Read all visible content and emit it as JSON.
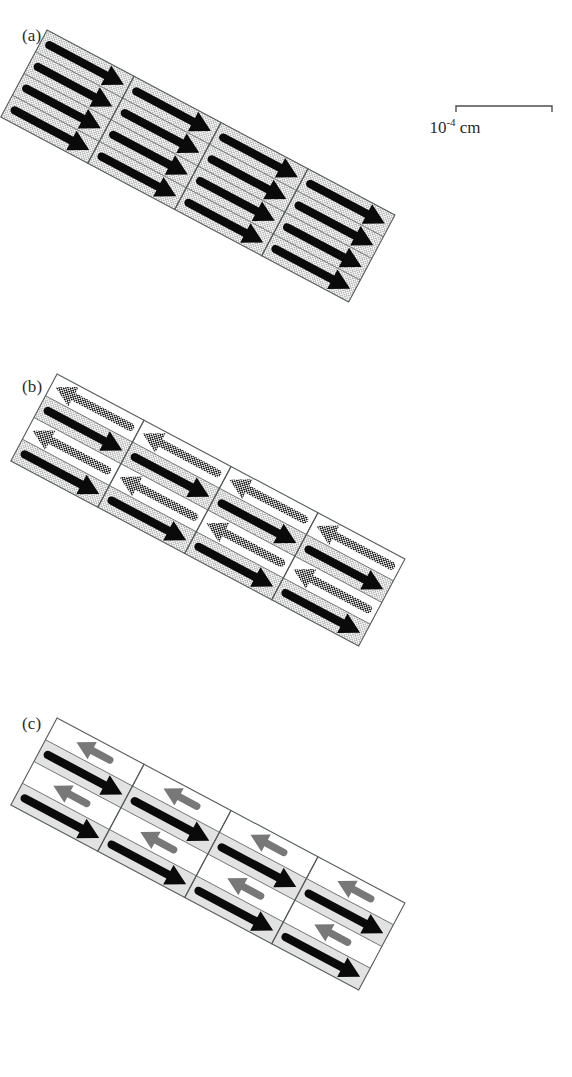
{
  "figure": {
    "kind": "magnetic-domain-schematic",
    "background_color": "#ffffff",
    "panel_count": 3
  },
  "panels": [
    {
      "id": "a",
      "label": "(a)",
      "label_x": 22,
      "label_y": 26,
      "description": "saturated single-domain state",
      "origin_x": 47,
      "origin_y": 28,
      "rotation_deg": 28.0,
      "cell_count": 4,
      "cell_size": 98,
      "bands_per_cell": 4,
      "cell_fill": "stipple",
      "cell_fill_color": "#e9e9e9",
      "band_pattern": "uniform",
      "forward_band_fill": "stipple",
      "reverse_band_fill": "stipple",
      "arrows": [
        {
          "direction": "down-right",
          "fill": "solid-black",
          "color": "#0a0a0a",
          "length": "long"
        },
        {
          "direction": "down-right",
          "fill": "solid-black",
          "color": "#0a0a0a",
          "length": "long"
        },
        {
          "direction": "down-right",
          "fill": "solid-black",
          "color": "#0a0a0a",
          "length": "long"
        },
        {
          "direction": "down-right",
          "fill": "solid-black",
          "color": "#0a0a0a",
          "length": "long"
        }
      ]
    },
    {
      "id": "b",
      "label": "(b)",
      "label_x": 22,
      "label_y": 377,
      "description": "antiparallel domain state, halftone reverse arrows",
      "origin_x": 57,
      "origin_y": 372,
      "rotation_deg": 28.0,
      "cell_count": 4,
      "cell_size": 98,
      "bands_per_cell": 4,
      "cell_fill": "mixed",
      "cell_fill_color": "#e9e9e9",
      "band_pattern": "alternating",
      "forward_band_fill": "stipple",
      "reverse_band_fill": "white",
      "arrows": [
        {
          "direction": "up-left",
          "fill": "halftone",
          "color": "#2a2a2a",
          "length": "long"
        },
        {
          "direction": "down-right",
          "fill": "solid-black",
          "color": "#0a0a0a",
          "length": "long"
        },
        {
          "direction": "up-left",
          "fill": "halftone",
          "color": "#2a2a2a",
          "length": "long"
        },
        {
          "direction": "down-right",
          "fill": "solid-black",
          "color": "#0a0a0a",
          "length": "long"
        }
      ]
    },
    {
      "id": "c",
      "label": "(c)",
      "label_x": 22,
      "label_y": 714,
      "description": "narrow reverse domains on grey bands",
      "origin_x": 57,
      "origin_y": 716,
      "rotation_deg": 28.0,
      "cell_count": 4,
      "cell_size": 98,
      "bands_per_cell": 4,
      "cell_fill": "mixed",
      "cell_fill_color": "#e2e2e2",
      "band_pattern": "alternating",
      "forward_band_fill": "grey",
      "reverse_band_fill": "white",
      "arrows": [
        {
          "direction": "up-left",
          "fill": "grey",
          "color": "#787878",
          "length": "short"
        },
        {
          "direction": "down-right",
          "fill": "solid-black",
          "color": "#0a0a0a",
          "length": "long"
        },
        {
          "direction": "up-left",
          "fill": "grey",
          "color": "#787878",
          "length": "short"
        },
        {
          "direction": "down-right",
          "fill": "solid-black",
          "color": "#0a0a0a",
          "length": "long"
        }
      ]
    }
  ],
  "scalebar": {
    "x": 455,
    "y": 104,
    "length_px": 97,
    "tick_height": 8,
    "caption": "10",
    "exponent": "-4",
    "unit": "cm",
    "caption_full": "10-4 cm",
    "color": "#4d4d4d"
  },
  "colors": {
    "black": "#0a0a0a",
    "grey_arrow": "#787878",
    "grey_band": "#e2e2e2",
    "stipple_band": "#e9e9e9",
    "outline": "#555c5c",
    "text": "#2b2b2b",
    "background": "#ffffff"
  }
}
